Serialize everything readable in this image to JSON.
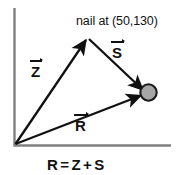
{
  "figure": {
    "background_color": "#ffffff",
    "ink_color": "#111111",
    "axis_color": "#808080",
    "ball_fill_color": "#a6a6a6",
    "ball_stroke_color": "#1a1a1a"
  },
  "axes": {
    "origin_label": "",
    "vertical_axis_name": "y-axis",
    "horizontal_axis_name": "x-axis"
  },
  "annotations": {
    "nail_label": "nail at (50,130)",
    "nail_x": "50",
    "nail_y": "130"
  },
  "vectors": [
    {
      "name": "Z",
      "label": "Z",
      "description": "vector from origin to nail",
      "from": "origin",
      "to": "nail"
    },
    {
      "name": "S",
      "label": "S",
      "description": "vector from nail to ball",
      "from": "nail",
      "to": "ball"
    },
    {
      "name": "R",
      "label": "R",
      "description": "resultant vector from origin to ball",
      "from": "origin",
      "to": "ball"
    }
  ],
  "equation": {
    "lhs": "R",
    "operator_equals": "=",
    "term1": "Z",
    "operator_plus": "+",
    "term2": "S",
    "full_text": "R = Z + S"
  },
  "objects": {
    "ball_name": "ball",
    "nail_name": "nail"
  }
}
